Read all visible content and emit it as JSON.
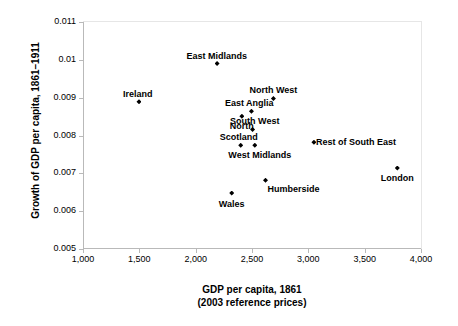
{
  "chart_data": {
    "type": "scatter",
    "title": "",
    "xlabel_line1": "GDP per capita, 1861",
    "xlabel_line2": "(2003 reference prices)",
    "ylabel": "Growth of GDP per capita, 1861–1911",
    "xlim": [
      1000,
      4000
    ],
    "ylim": [
      0.005,
      0.011
    ],
    "xticks": [
      "1,000",
      "1,500",
      "2,000",
      "2,500",
      "3,000",
      "3,500",
      "4,000"
    ],
    "xtick_values": [
      1000,
      1500,
      2000,
      2500,
      3000,
      3500,
      4000
    ],
    "yticks": [
      "0.005",
      "0.006",
      "0.007",
      "0.008",
      "0.009",
      "0.01",
      "0.011"
    ],
    "ytick_values": [
      0.005,
      0.006,
      0.007,
      0.008,
      0.009,
      0.01,
      0.011
    ],
    "grid": false,
    "legend": "none",
    "marker": "diamond",
    "marker_color": "#000000",
    "points": [
      {
        "label": "Ireland",
        "x": 1497,
        "y": 0.00889,
        "label_dx": -1,
        "label_dy": -13,
        "align": "center"
      },
      {
        "label": "East Midlands",
        "x": 2190,
        "y": 0.0099,
        "label_dx": 0,
        "label_dy": -13,
        "align": "center"
      },
      {
        "label": "East Anglia",
        "x": 2495,
        "y": 0.00864,
        "label_dx": -2,
        "label_dy": -13,
        "align": "center"
      },
      {
        "label": "North",
        "x": 2410,
        "y": 0.00851,
        "label_dx": 0,
        "label_dy": 5,
        "align": "center"
      },
      {
        "label": "North West",
        "x": 2690,
        "y": 0.00898,
        "label_dx": 0,
        "label_dy": -13,
        "align": "center"
      },
      {
        "label": "South West",
        "x": 2505,
        "y": 0.00816,
        "label_dx": 2,
        "label_dy": -13,
        "align": "center"
      },
      {
        "label": "Scotland",
        "x": 2400,
        "y": 0.00774,
        "label_dx": -2,
        "label_dy": -13,
        "align": "center"
      },
      {
        "label": "West Midlands",
        "x": 2525,
        "y": 0.00774,
        "label_dx": 5,
        "label_dy": 5,
        "align": "center"
      },
      {
        "label": "Rest of South East",
        "x": 3050,
        "y": 0.00782,
        "label_dx": 42,
        "label_dy": -5,
        "align": "center"
      },
      {
        "label": "Humberside",
        "x": 2620,
        "y": 0.00682,
        "label_dx": 28,
        "label_dy": 4,
        "align": "center"
      },
      {
        "label": "Wales",
        "x": 2320,
        "y": 0.00648,
        "label_dx": 0,
        "label_dy": 6,
        "align": "center"
      },
      {
        "label": "London",
        "x": 3790,
        "y": 0.00714,
        "label_dx": 0,
        "label_dy": 5,
        "align": "center"
      }
    ]
  },
  "bottom_note": ""
}
